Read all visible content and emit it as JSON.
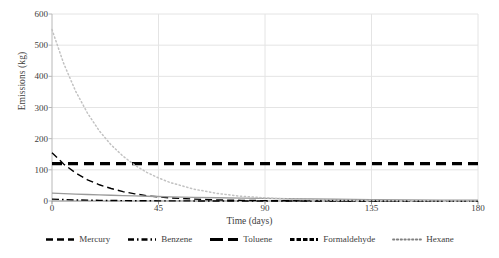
{
  "chart_data": {
    "type": "line",
    "title": "",
    "xlabel": "Time (days)",
    "ylabel": "Emissions (kg)",
    "xlim": [
      0,
      180
    ],
    "ylim": [
      0,
      600
    ],
    "xticks": [
      0,
      45,
      90,
      135,
      180
    ],
    "yticks": [
      0,
      100,
      200,
      300,
      400,
      500,
      600
    ],
    "grid": true,
    "legend_position": "bottom",
    "x": [
      0,
      5,
      10,
      15,
      20,
      25,
      30,
      35,
      40,
      45,
      50,
      60,
      70,
      80,
      90,
      100,
      110,
      120,
      135,
      150,
      165,
      180
    ],
    "series": [
      {
        "name": "Mercury",
        "style": "dashed",
        "color": "#000000",
        "values": [
          155,
          118,
          90,
          68,
          52,
          40,
          30,
          23,
          17,
          13,
          10,
          6,
          3.5,
          2,
          1.2,
          0.7,
          0.4,
          0.25,
          0.1,
          0.05,
          0.02,
          0.01
        ]
      },
      {
        "name": "Benzene",
        "style": "dash-dot",
        "color": "#000000",
        "values": [
          6,
          4.6,
          3.5,
          2.7,
          2.0,
          1.6,
          1.2,
          0.9,
          0.7,
          0.5,
          0.4,
          0.24,
          0.14,
          0.08,
          0.05,
          0.03,
          0.017,
          0.01,
          0.004,
          0.002,
          0.001,
          0.0005
        ]
      },
      {
        "name": "Toluene",
        "style": "solid",
        "color": "#9a9a9a",
        "values": [
          25,
          23.5,
          22.1,
          20.8,
          19.6,
          18.4,
          17.3,
          16.3,
          15.3,
          14.4,
          13.5,
          11.9,
          10.5,
          9.3,
          8.2,
          7.2,
          6.4,
          5.6,
          4.6,
          3.8,
          3.1,
          2.6
        ]
      },
      {
        "name": "Formaldehyde",
        "style": "dashed-thick",
        "color": "#000000",
        "values": [
          120,
          120,
          120,
          120,
          120,
          120,
          120,
          120,
          120,
          120,
          120,
          120,
          120,
          120,
          120,
          120,
          120,
          120,
          120,
          120,
          120,
          120
        ]
      },
      {
        "name": "Hexane",
        "style": "dotted",
        "color": "#c2c2c2",
        "values": [
          550,
          440,
          352,
          282,
          225,
          180,
          144,
          115,
          92,
          74,
          59,
          38,
          24,
          15,
          10,
          6.2,
          4,
          2.5,
          1.3,
          0.6,
          0.3,
          0.15
        ]
      }
    ]
  },
  "axes": {
    "ylabel": "Emissions (kg)",
    "xlabel": "Time (days)",
    "yticks": [
      "0",
      "100",
      "200",
      "300",
      "400",
      "500",
      "600"
    ],
    "xticks": [
      "0",
      "45",
      "90",
      "135",
      "180"
    ]
  },
  "legend": {
    "items": [
      {
        "label": "Mercury",
        "icon": "dashed-line-icon",
        "color": "#000000"
      },
      {
        "label": "Benzene",
        "icon": "dash-dot-line-icon",
        "color": "#000000"
      },
      {
        "label": "Toluene",
        "icon": "solid-line-icon",
        "color": "#000000"
      },
      {
        "label": "Formaldehyde",
        "icon": "thick-dashed-line-icon",
        "color": "#000000"
      },
      {
        "label": "Hexane",
        "icon": "dotted-line-icon",
        "color": "#808080"
      }
    ]
  }
}
